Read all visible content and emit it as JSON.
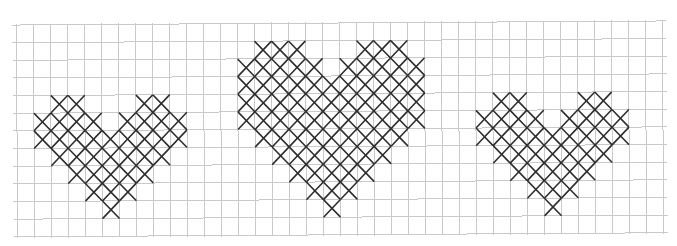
{
  "title": "Cross-stitch heart patterns",
  "grid": {
    "cols": 38,
    "rows": 12,
    "origin_x": 17,
    "origin_y": 23,
    "cell_w": 17.0,
    "cell_h": 17.65,
    "rotation_deg": -0.36,
    "line_color": "#c9c9c9",
    "overhang": 4
  },
  "stitch": {
    "color": "#2e2e2e",
    "inset": 0.5
  },
  "hearts": [
    {
      "name": "small-heart-left",
      "rows": [
        {
          "row": 4,
          "spans": [
            [
              2,
              3
            ],
            [
              7,
              8
            ]
          ]
        },
        {
          "row": 5,
          "spans": [
            [
              1,
              4
            ],
            [
              6,
              9
            ]
          ]
        },
        {
          "row": 6,
          "spans": [
            [
              1,
              9
            ]
          ]
        },
        {
          "row": 7,
          "spans": [
            [
              2,
              8
            ]
          ]
        },
        {
          "row": 8,
          "spans": [
            [
              3,
              7
            ]
          ]
        },
        {
          "row": 9,
          "spans": [
            [
              4,
              6
            ]
          ]
        },
        {
          "row": 10,
          "spans": [
            [
              5,
              5
            ]
          ]
        }
      ]
    },
    {
      "name": "large-heart-center",
      "rows": [
        {
          "row": 1,
          "spans": [
            [
              14,
              16
            ],
            [
              20,
              22
            ]
          ]
        },
        {
          "row": 2,
          "spans": [
            [
              13,
              17
            ],
            [
              19,
              23
            ]
          ]
        },
        {
          "row": 3,
          "spans": [
            [
              13,
              23
            ]
          ]
        },
        {
          "row": 4,
          "spans": [
            [
              13,
              23
            ]
          ]
        },
        {
          "row": 5,
          "spans": [
            [
              13,
              23
            ]
          ]
        },
        {
          "row": 6,
          "spans": [
            [
              14,
              22
            ]
          ]
        },
        {
          "row": 7,
          "spans": [
            [
              15,
              21
            ]
          ]
        },
        {
          "row": 8,
          "spans": [
            [
              16,
              20
            ]
          ]
        },
        {
          "row": 9,
          "spans": [
            [
              17,
              19
            ]
          ]
        },
        {
          "row": 10,
          "spans": [
            [
              18,
              18
            ]
          ]
        }
      ]
    },
    {
      "name": "small-heart-right",
      "rows": [
        {
          "row": 4,
          "spans": [
            [
              28,
              29
            ],
            [
              33,
              34
            ]
          ]
        },
        {
          "row": 5,
          "spans": [
            [
              27,
              30
            ],
            [
              32,
              35
            ]
          ]
        },
        {
          "row": 6,
          "spans": [
            [
              27,
              35
            ]
          ]
        },
        {
          "row": 7,
          "spans": [
            [
              28,
              34
            ]
          ]
        },
        {
          "row": 8,
          "spans": [
            [
              29,
              33
            ]
          ]
        },
        {
          "row": 9,
          "spans": [
            [
              30,
              32
            ]
          ]
        },
        {
          "row": 10,
          "spans": [
            [
              31,
              31
            ]
          ]
        }
      ]
    }
  ]
}
